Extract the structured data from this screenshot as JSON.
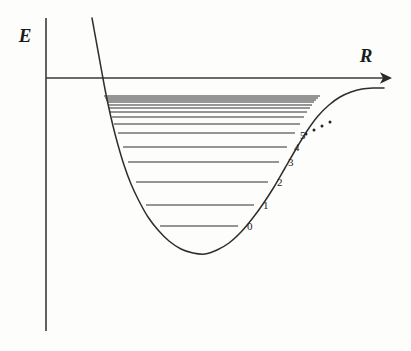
{
  "figure": {
    "background_color": "#fdfdfc",
    "ink_color": "#2e2e2e"
  },
  "axes": {
    "y_label": "E",
    "x_label": "R",
    "y_axis": {
      "x": 46,
      "y_top": 18,
      "y_bottom": 331
    },
    "x_axis": {
      "y": 78,
      "x_left": 46,
      "x_right": 392,
      "arrow": "right"
    }
  },
  "labels": {
    "energy_label_pos": {
      "x": 25,
      "y": 42
    },
    "distance_label_pos": {
      "x": 366,
      "y": 62
    }
  },
  "chart_data": {
    "type": "line",
    "xlabel": "R",
    "ylabel": "E",
    "grid": false,
    "legend": null,
    "curve": {
      "name": "Morse potential V(R)",
      "description": "Anharmonic diatomic potential: steep repulsive inner wall, minimum near R_e, asymptotic approach to dissociation limit",
      "points": [
        [
          92,
          18
        ],
        [
          96,
          40
        ],
        [
          100,
          62
        ],
        [
          104,
          84
        ],
        [
          108,
          104
        ],
        [
          113,
          126
        ],
        [
          118,
          145
        ],
        [
          124,
          165
        ],
        [
          131,
          184
        ],
        [
          139,
          201
        ],
        [
          148,
          217
        ],
        [
          158,
          230
        ],
        [
          169,
          241
        ],
        [
          181,
          249
        ],
        [
          193,
          253
        ],
        [
          205,
          254
        ],
        [
          217,
          250
        ],
        [
          229,
          243
        ],
        [
          241,
          232
        ],
        [
          252,
          219
        ],
        [
          263,
          204
        ],
        [
          274,
          187
        ],
        [
          285,
          168
        ],
        [
          296,
          149
        ],
        [
          307,
          131
        ],
        [
          318,
          116
        ],
        [
          329,
          105
        ],
        [
          340,
          97
        ],
        [
          351,
          92
        ],
        [
          362,
          89
        ],
        [
          373,
          88
        ],
        [
          384,
          88
        ]
      ],
      "minimum": {
        "x": 199,
        "y": 254
      },
      "dissociation_asymptote_y": 88
    },
    "energy_levels": [
      {
        "v": "0",
        "label": "0",
        "y": 226,
        "x_left": 160,
        "x_right": 238,
        "label_x": 247,
        "label_y": 230
      },
      {
        "v": "1",
        "label": "1",
        "y": 205,
        "x_left": 146,
        "x_right": 254,
        "label_x": 263,
        "label_y": 209
      },
      {
        "v": "2",
        "label": "2",
        "y": 182,
        "x_left": 136,
        "x_right": 268,
        "label_x": 277,
        "label_y": 186
      },
      {
        "v": "3",
        "label": "3",
        "y": 162,
        "x_left": 128,
        "x_right": 279,
        "label_x": 288,
        "label_y": 166
      },
      {
        "v": "4",
        "label": "4",
        "y": 147,
        "x_left": 123,
        "x_right": 287,
        "label_x": 294,
        "label_y": 151
      },
      {
        "v": "5",
        "label": "5",
        "y": 133,
        "x_left": 118,
        "x_right": 295,
        "label_x": 300,
        "label_y": 139
      },
      {
        "v": "6",
        "label": "",
        "y": 124,
        "x_left": 114,
        "x_right": 300,
        "label_x": 0,
        "label_y": 0
      },
      {
        "v": "7",
        "label": "",
        "y": 117,
        "x_left": 112,
        "x_right": 304,
        "label_x": 0,
        "label_y": 0
      },
      {
        "v": "8",
        "label": "",
        "y": 112,
        "x_left": 110,
        "x_right": 307,
        "label_x": 0,
        "label_y": 0
      },
      {
        "v": "9",
        "label": "",
        "y": 108,
        "x_left": 109,
        "x_right": 310,
        "label_x": 0,
        "label_y": 0
      },
      {
        "v": "10",
        "label": "",
        "y": 105,
        "x_left": 108,
        "x_right": 312,
        "label_x": 0,
        "label_y": 0
      },
      {
        "v": "11",
        "label": "",
        "y": 102,
        "x_left": 107,
        "x_right": 314,
        "label_x": 0,
        "label_y": 0
      },
      {
        "v": "12",
        "label": "",
        "y": 100,
        "x_left": 106,
        "x_right": 316,
        "label_x": 0,
        "label_y": 0
      },
      {
        "v": "13",
        "label": "",
        "y": 98,
        "x_left": 105,
        "x_right": 318,
        "label_x": 0,
        "label_y": 0
      },
      {
        "v": "14",
        "label": "",
        "y": 96,
        "x_left": 104,
        "x_right": 320,
        "label_x": 0,
        "label_y": 0
      }
    ],
    "continuation_dots": [
      {
        "x": 306,
        "y": 134
      },
      {
        "x": 314,
        "y": 130
      },
      {
        "x": 322,
        "y": 126
      },
      {
        "x": 330,
        "y": 122
      }
    ],
    "visible_level_labels": [
      "0",
      "1",
      "2",
      "3",
      "4",
      "5"
    ]
  }
}
